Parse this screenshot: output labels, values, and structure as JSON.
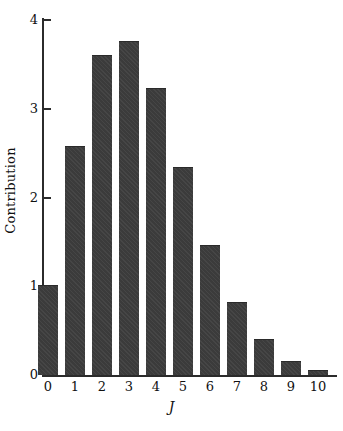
{
  "chart_data": {
    "type": "bar",
    "title": "",
    "subtitle": "",
    "xlabel": "J",
    "ylabel": "Contribution",
    "categories": [
      "0",
      "1",
      "2",
      "3",
      "4",
      "5",
      "6",
      "7",
      "8",
      "9",
      "10"
    ],
    "values": [
      1.0,
      2.57,
      3.6,
      3.75,
      3.22,
      2.33,
      1.45,
      0.81,
      0.39,
      0.15,
      0.05
    ],
    "series": [
      {
        "name": "Contribution",
        "values": [
          1.0,
          2.57,
          3.6,
          3.75,
          3.22,
          2.33,
          1.45,
          0.81,
          0.39,
          0.15,
          0.05
        ]
      }
    ],
    "ylim": [
      0,
      4
    ],
    "xlim": [
      -0.6,
      10.6
    ],
    "y_ticks": [
      0,
      1,
      2,
      3,
      4
    ],
    "y_tick_labels": [
      "0",
      "1",
      "2",
      "3",
      "4"
    ],
    "x_tick_labels": [
      "0",
      "1",
      "2",
      "3",
      "4",
      "5",
      "6",
      "7",
      "8",
      "9",
      "10"
    ],
    "grid": false,
    "legend": false,
    "legend_position": "none",
    "bar_color": "#3b3b3b",
    "axis_color": "#2b2b2b",
    "background_color": "#ffffff"
  }
}
